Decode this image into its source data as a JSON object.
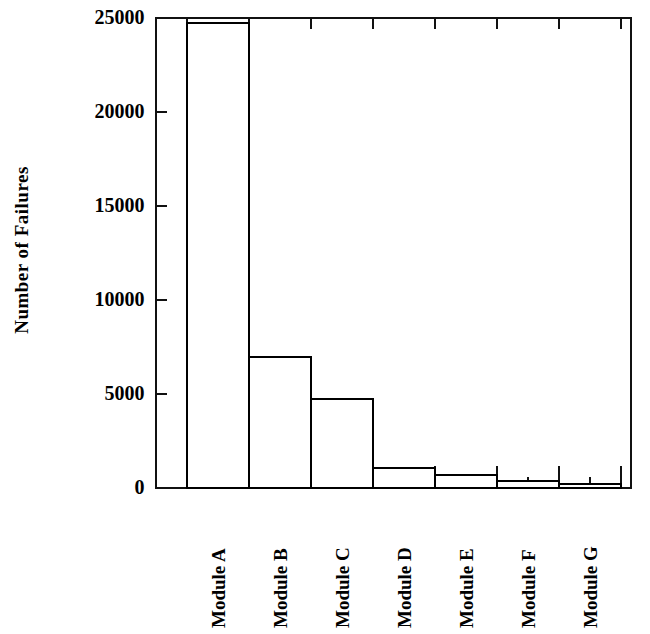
{
  "chart_data": {
    "type": "bar",
    "title": "",
    "subtitle": "",
    "xlabel": "",
    "ylabel": "Number of Failures",
    "categories": [
      "Module A",
      "Module B",
      "Module C",
      "Module D",
      "Module E",
      "Module F",
      "Module G"
    ],
    "values": [
      24700,
      6950,
      4730,
      1060,
      640,
      320,
      210
    ],
    "series": [
      {
        "name": "Number of Failures",
        "values": [
          24700,
          6950,
          4730,
          1060,
          640,
          320,
          210
        ]
      }
    ],
    "ylim": [
      0,
      25000
    ],
    "ytick_values": [
      0,
      5000,
      10000,
      15000,
      20000,
      25000
    ],
    "ytick_labels": [
      "0",
      "5000",
      "10000",
      "15000",
      "20000",
      "25000"
    ],
    "grid": false,
    "legend": false,
    "legend_position": "none",
    "annotations": [],
    "style": {
      "bar_fill": "#ffffff",
      "bar_stroke": "#000000",
      "axis_color": "#000000",
      "background": "#ffffff",
      "tick_direction": "inward",
      "frame": "full-box"
    }
  },
  "axes": {
    "y_label": "Number of Failures",
    "y_ticks": [
      {
        "label": "25000",
        "value": 25000
      },
      {
        "label": "20000",
        "value": 20000
      },
      {
        "label": "15000",
        "value": 15000
      },
      {
        "label": "10000",
        "value": 10000
      },
      {
        "label": "5000",
        "value": 5000
      },
      {
        "label": "0",
        "value": 0
      }
    ],
    "x_ticks": [
      {
        "label": "Module A"
      },
      {
        "label": "Module B"
      },
      {
        "label": "Module C"
      },
      {
        "label": "Module D"
      },
      {
        "label": "Module E"
      },
      {
        "label": "Module F"
      },
      {
        "label": "Module G"
      }
    ]
  }
}
